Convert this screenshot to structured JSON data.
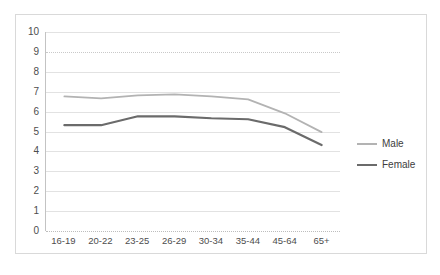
{
  "chart_data": {
    "type": "line",
    "title": "",
    "subtitle": "",
    "xlabel": "",
    "ylabel": "",
    "categories": [
      "16-19",
      "20-22",
      "23-25",
      "26-29",
      "30-34",
      "35-44",
      "45-64",
      "65+"
    ],
    "series": [
      {
        "name": "Male",
        "color": "#b3b3b3",
        "values": [
          6.75,
          6.65,
          6.8,
          6.85,
          6.75,
          6.6,
          5.9,
          4.95
        ]
      },
      {
        "name": "Female",
        "color": "#6b6b6b",
        "values": [
          5.3,
          5.3,
          5.75,
          5.75,
          5.65,
          5.6,
          5.2,
          4.3
        ]
      }
    ],
    "ylim": [
      0,
      10
    ],
    "y_ticks": [
      0,
      1,
      2,
      3,
      4,
      5,
      6,
      7,
      8,
      9,
      10
    ],
    "y_tick_labels": [
      "0",
      "1",
      "2",
      "3",
      "4",
      "5",
      "6",
      "7",
      "8",
      "9",
      "10"
    ],
    "grid": true,
    "legend_position": "right"
  },
  "legend": {
    "entries": [
      {
        "label": "Male"
      },
      {
        "label": "Female"
      }
    ]
  }
}
